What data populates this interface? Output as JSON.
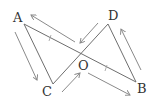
{
  "diagram": {
    "type": "geometry",
    "points": {
      "A": {
        "label": "A",
        "x": 20,
        "y": 20
      },
      "D": {
        "label": "D",
        "x": 110,
        "y": 20
      },
      "C": {
        "label": "C",
        "x": 53,
        "y": 85
      },
      "B": {
        "label": "B",
        "x": 138,
        "y": 83
      },
      "O": {
        "label": "O",
        "x": 80,
        "y": 55
      }
    },
    "segments": [
      "AC",
      "AB",
      "CD",
      "DB"
    ],
    "arrows": [
      {
        "along": "AC",
        "direction": "A to C"
      },
      {
        "along": "OA",
        "direction": "O to A"
      },
      {
        "along": "DO",
        "direction": "D to O"
      },
      {
        "along": "CO",
        "direction": "C to O"
      },
      {
        "along": "OB",
        "direction": "O to B"
      },
      {
        "along": "BD",
        "direction": "B to D"
      }
    ],
    "tick_marks": [
      "AO",
      "OB"
    ],
    "colors": {
      "line": "#6e6e6e",
      "arrow": "#8a8a8a",
      "text": "#333333"
    }
  }
}
